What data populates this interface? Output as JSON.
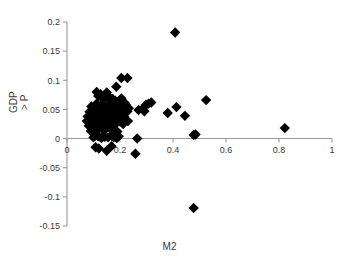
{
  "chart_data": {
    "type": "scatter",
    "title": "",
    "xlabel": "M2",
    "ylabel": "GDP > P",
    "ylabel_line1": "GDP",
    "ylabel_line2": "> P",
    "xlim": [
      0,
      1
    ],
    "ylim": [
      -0.15,
      0.2
    ],
    "xticks": [
      0,
      0.2,
      0.4,
      0.6,
      0.8,
      1
    ],
    "xtick_labels": [
      "0",
      "0.2",
      "0.4",
      "0.6",
      "0.8",
      "1"
    ],
    "yticks": [
      -0.15,
      -0.1,
      -0.05,
      0,
      0.05,
      0.1,
      0.15,
      0.2
    ],
    "ytick_labels": [
      "-0.15",
      "-0.1",
      "-0.05",
      "0",
      "0.05",
      "0.1",
      "0.15",
      "0.2"
    ],
    "grid": false,
    "legend": false,
    "marker": "diamond",
    "marker_color": "#000000",
    "marker_size": 5.2,
    "axis_color": "#9a9a9a",
    "series": [
      {
        "name": "observations",
        "points": [
          [
            0.075,
            0.03
          ],
          [
            0.078,
            0.038
          ],
          [
            0.082,
            0.022
          ],
          [
            0.085,
            0.046
          ],
          [
            0.088,
            0.031
          ],
          [
            0.09,
            0.013
          ],
          [
            0.092,
            0.055
          ],
          [
            0.094,
            0.037
          ],
          [
            0.096,
            0.026
          ],
          [
            0.098,
            0.044
          ],
          [
            0.1,
            0.018
          ],
          [
            0.101,
            0.035
          ],
          [
            0.103,
            0.051
          ],
          [
            0.105,
            0.029
          ],
          [
            0.107,
            0.041
          ],
          [
            0.108,
            0.01
          ],
          [
            0.11,
            0.033
          ],
          [
            0.112,
            0.06
          ],
          [
            0.114,
            0.024
          ],
          [
            0.115,
            0.047
          ],
          [
            0.117,
            0.036
          ],
          [
            0.118,
            0.016
          ],
          [
            0.12,
            0.042
          ],
          [
            0.122,
            0.028
          ],
          [
            0.124,
            0.053
          ],
          [
            0.125,
            0.034
          ],
          [
            0.127,
            0.021
          ],
          [
            0.129,
            0.045
          ],
          [
            0.13,
            0.038
          ],
          [
            0.132,
            0.03
          ],
          [
            0.134,
            0.058
          ],
          [
            0.135,
            0.025
          ],
          [
            0.137,
            0.048
          ],
          [
            0.139,
            0.032
          ],
          [
            0.14,
            0.014
          ],
          [
            0.142,
            0.04
          ],
          [
            0.144,
            0.027
          ],
          [
            0.145,
            0.052
          ],
          [
            0.147,
            0.036
          ],
          [
            0.149,
            0.019
          ],
          [
            0.15,
            0.043
          ],
          [
            0.152,
            0.031
          ],
          [
            0.154,
            0.056
          ],
          [
            0.155,
            0.023
          ],
          [
            0.157,
            0.039
          ],
          [
            0.159,
            0.049
          ],
          [
            0.16,
            0.029
          ],
          [
            0.162,
            0.035
          ],
          [
            0.164,
            0.017
          ],
          [
            0.165,
            0.046
          ],
          [
            0.167,
            0.033
          ],
          [
            0.169,
            0.062
          ],
          [
            0.17,
            0.026
          ],
          [
            0.172,
            0.041
          ],
          [
            0.174,
            0.037
          ],
          [
            0.175,
            0.05
          ],
          [
            0.177,
            0.022
          ],
          [
            0.179,
            0.044
          ],
          [
            0.18,
            0.031
          ],
          [
            0.182,
            0.065
          ],
          [
            0.184,
            0.028
          ],
          [
            0.185,
            0.039
          ],
          [
            0.187,
            0.047
          ],
          [
            0.189,
            0.034
          ],
          [
            0.19,
            0.012
          ],
          [
            0.192,
            0.042
          ],
          [
            0.195,
            0.057
          ],
          [
            0.198,
            0.036
          ],
          [
            0.2,
            0.029
          ],
          [
            0.202,
            0.048
          ],
          [
            0.205,
            0.069
          ],
          [
            0.208,
            0.033
          ],
          [
            0.21,
            0.044
          ],
          [
            0.212,
            0.025
          ],
          [
            0.215,
            0.038
          ],
          [
            0.218,
            0.055
          ],
          [
            0.22,
            0.03
          ],
          [
            0.112,
            0.08
          ],
          [
            0.118,
            0.073
          ],
          [
            0.127,
            0.076
          ],
          [
            0.133,
            0.069
          ],
          [
            0.145,
            0.07
          ],
          [
            0.15,
            0.079
          ],
          [
            0.158,
            0.072
          ],
          [
            0.163,
            0.066
          ],
          [
            0.172,
            0.068
          ],
          [
            0.186,
            0.089
          ],
          [
            0.205,
            0.104
          ],
          [
            0.228,
            0.104
          ],
          [
            0.21,
            0.063
          ],
          [
            0.218,
            0.061
          ],
          [
            0.222,
            0.058
          ],
          [
            0.228,
            0.047
          ],
          [
            0.233,
            0.052
          ],
          [
            0.215,
            0.029
          ],
          [
            0.23,
            0.03
          ],
          [
            0.1,
            0.002
          ],
          [
            0.118,
            0.004
          ],
          [
            0.13,
            0.001
          ],
          [
            0.142,
            0.003
          ],
          [
            0.155,
            0.002
          ],
          [
            0.168,
            0.005
          ],
          [
            0.176,
            0.002
          ],
          [
            0.188,
            0.001
          ],
          [
            0.195,
            0.004
          ],
          [
            0.265,
            0.0
          ],
          [
            0.108,
            -0.015
          ],
          [
            0.12,
            -0.017
          ],
          [
            0.15,
            -0.021
          ],
          [
            0.168,
            -0.013
          ],
          [
            0.258,
            -0.026
          ],
          [
            0.27,
            0.049
          ],
          [
            0.285,
            0.051
          ],
          [
            0.292,
            0.047
          ],
          [
            0.298,
            0.058
          ],
          [
            0.308,
            0.06
          ],
          [
            0.318,
            0.062
          ],
          [
            0.38,
            0.044
          ],
          [
            0.413,
            0.054
          ],
          [
            0.445,
            0.039
          ],
          [
            0.478,
            0.006
          ],
          [
            0.485,
            0.007
          ],
          [
            0.525,
            0.066
          ],
          [
            0.822,
            0.018
          ],
          [
            0.408,
            0.182
          ],
          [
            0.478,
            -0.119
          ]
        ]
      }
    ],
    "n_points": 126
  },
  "axis_render": {
    "plot_left_px": 67,
    "plot_right_px": 332,
    "plot_top_px": 22,
    "plot_bottom_px": 226,
    "zero_y_px": 148
  }
}
